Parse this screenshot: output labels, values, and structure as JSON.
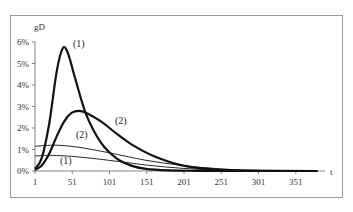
{
  "chart_data": {
    "type": "line",
    "title": "",
    "xlabel": "t",
    "ylabel": "gD",
    "ylim": [
      0,
      6
    ],
    "xlim": [
      1,
      380
    ],
    "x_ticks": [
      "1",
      "51",
      "101",
      "151",
      "201",
      "251",
      "301",
      "351"
    ],
    "y_ticks": [
      "0%",
      "1%",
      "2%",
      "3%",
      "4%",
      "5%",
      "6%"
    ],
    "grid": false,
    "legend": "none (inline curve labels)",
    "series": [
      {
        "name": "(1) bold",
        "style": "thick",
        "x": [
          1,
          10,
          20,
          30,
          38,
          45,
          55,
          70,
          90,
          110,
          130,
          150,
          180,
          220,
          260,
          380
        ],
        "y": [
          0.1,
          0.6,
          2.2,
          4.6,
          5.7,
          5.5,
          4.3,
          2.6,
          1.3,
          0.6,
          0.25,
          0.1,
          0.03,
          0.01,
          0.0,
          0.0
        ]
      },
      {
        "name": "(2) bold",
        "style": "thick",
        "x": [
          1,
          10,
          20,
          30,
          40,
          50,
          60,
          70,
          90,
          110,
          130,
          160,
          200,
          240,
          280,
          380
        ],
        "y": [
          0.05,
          0.25,
          0.8,
          1.6,
          2.3,
          2.7,
          2.8,
          2.7,
          2.3,
          1.75,
          1.25,
          0.7,
          0.25,
          0.08,
          0.02,
          0.0
        ]
      },
      {
        "name": "(2) thin",
        "style": "thin",
        "x": [
          1,
          30,
          60,
          100,
          150,
          200,
          250,
          300,
          380
        ],
        "y": [
          1.15,
          1.2,
          1.1,
          0.85,
          0.5,
          0.25,
          0.1,
          0.03,
          0.0
        ]
      },
      {
        "name": "(1) thin",
        "style": "thin",
        "x": [
          1,
          30,
          60,
          100,
          150,
          200,
          250,
          300,
          380
        ],
        "y": [
          0.7,
          0.72,
          0.65,
          0.5,
          0.28,
          0.12,
          0.04,
          0.01,
          0.0
        ]
      }
    ],
    "annotations": [
      {
        "text": "(1)",
        "near": "peak of thick curve 1"
      },
      {
        "text": "(2)",
        "near": "right of thick curve 2"
      },
      {
        "text": "(2)",
        "near": "thin curve 2"
      },
      {
        "text": "(1)",
        "near": "thin curve 1"
      }
    ]
  },
  "labels": {
    "y_axis": "gD",
    "x_axis": "t",
    "thick1": "(1)",
    "thick2": "(2)",
    "thin2": "(2)",
    "thin1": "(1)"
  },
  "ticks": {
    "x": [
      "1",
      "51",
      "101",
      "151",
      "201",
      "251",
      "301",
      "351"
    ],
    "y": [
      "0%",
      "1%",
      "2%",
      "3%",
      "4%",
      "5%",
      "6%"
    ]
  }
}
